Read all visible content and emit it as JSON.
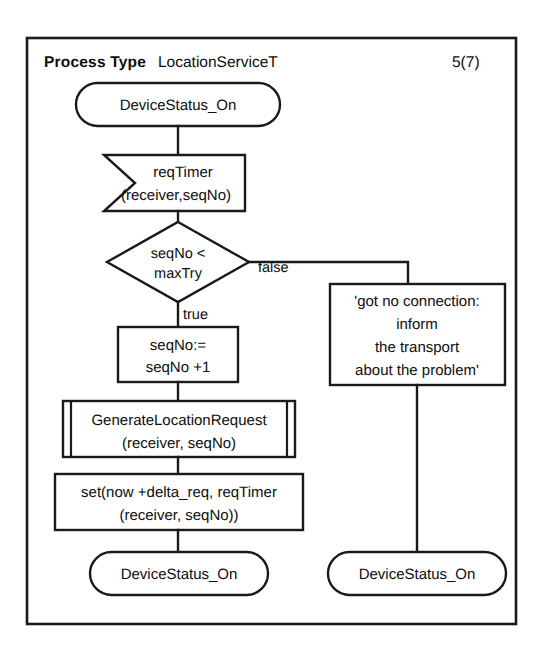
{
  "diagram": {
    "kind": "sdl-process-diagram",
    "header": {
      "type_label": "Process Type",
      "type_name": "LocationServiceT",
      "page_indicator": "5(7)"
    },
    "nodes": {
      "start_state": {
        "symbol": "state",
        "text": "DeviceStatus_On"
      },
      "input_signal": {
        "symbol": "input",
        "line1": "reqTimer",
        "line2": "(receiver,seqNo)"
      },
      "decision": {
        "symbol": "decision",
        "line1": "seqNo <",
        "line2": "maxTry"
      },
      "task_increment": {
        "symbol": "task",
        "line1": "seqNo:=",
        "line2": "seqNo +1"
      },
      "procedure_call": {
        "symbol": "procedure-call",
        "line1": "GenerateLocationRequest",
        "line2": "(receiver, seqNo)"
      },
      "task_set_timer": {
        "symbol": "task",
        "line1": "set(now +delta_req, reqTimer",
        "line2": "(receiver, seqNo))"
      },
      "end_state_left": {
        "symbol": "state",
        "text": "DeviceStatus_On"
      },
      "task_no_connection": {
        "symbol": "task",
        "line1": "'got no connection:",
        "line2": "inform",
        "line3": "the transport",
        "line4": "about the problem'"
      },
      "end_state_right": {
        "symbol": "state",
        "text": "DeviceStatus_On"
      }
    },
    "branch_labels": {
      "true": "true",
      "false": "false"
    },
    "colors": {
      "line": "#1a1a1a",
      "text": "#0d0d0d",
      "background": "#ffffff"
    }
  }
}
